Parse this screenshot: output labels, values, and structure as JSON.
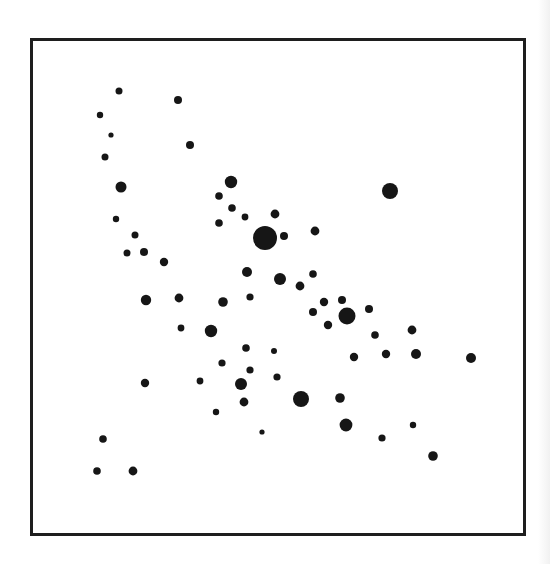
{
  "chart_data": {
    "type": "scatter",
    "title": "",
    "xlabel": "",
    "ylabel": "",
    "grid": false,
    "legend": null,
    "axis_ticks": false,
    "frame": {
      "x": 30,
      "y": 38,
      "width": 496,
      "height": 498,
      "stroke": "#1e1e1e",
      "stroke_width": 3
    },
    "marker_color": "#161616",
    "points": [
      {
        "x": 119,
        "y": 91,
        "r": 3.5
      },
      {
        "x": 178,
        "y": 100,
        "r": 4
      },
      {
        "x": 100,
        "y": 115,
        "r": 3.2
      },
      {
        "x": 111,
        "y": 135,
        "r": 2.6
      },
      {
        "x": 105,
        "y": 157,
        "r": 3.5
      },
      {
        "x": 190,
        "y": 145,
        "r": 4
      },
      {
        "x": 121,
        "y": 187,
        "r": 5.5
      },
      {
        "x": 116,
        "y": 219,
        "r": 3.2
      },
      {
        "x": 135,
        "y": 235,
        "r": 3.5
      },
      {
        "x": 127,
        "y": 253,
        "r": 3.5
      },
      {
        "x": 144,
        "y": 252,
        "r": 4
      },
      {
        "x": 164,
        "y": 262,
        "r": 4.2
      },
      {
        "x": 231,
        "y": 182,
        "r": 6.2
      },
      {
        "x": 219,
        "y": 196,
        "r": 3.8
      },
      {
        "x": 232,
        "y": 208,
        "r": 3.8
      },
      {
        "x": 245,
        "y": 217,
        "r": 3.4
      },
      {
        "x": 219,
        "y": 223,
        "r": 3.8
      },
      {
        "x": 275,
        "y": 214,
        "r": 4.4
      },
      {
        "x": 265,
        "y": 238,
        "r": 12
      },
      {
        "x": 284,
        "y": 236,
        "r": 4
      },
      {
        "x": 315,
        "y": 231,
        "r": 4.4
      },
      {
        "x": 390,
        "y": 191,
        "r": 8
      },
      {
        "x": 247,
        "y": 272,
        "r": 5
      },
      {
        "x": 280,
        "y": 279,
        "r": 6
      },
      {
        "x": 313,
        "y": 274,
        "r": 3.8
      },
      {
        "x": 300,
        "y": 286,
        "r": 4.4
      },
      {
        "x": 146,
        "y": 300,
        "r": 5.2
      },
      {
        "x": 179,
        "y": 298,
        "r": 4.4
      },
      {
        "x": 223,
        "y": 302,
        "r": 4.8
      },
      {
        "x": 250,
        "y": 297,
        "r": 3.6
      },
      {
        "x": 324,
        "y": 302,
        "r": 4.2
      },
      {
        "x": 342,
        "y": 300,
        "r": 4
      },
      {
        "x": 313,
        "y": 312,
        "r": 4
      },
      {
        "x": 347,
        "y": 316,
        "r": 8.5
      },
      {
        "x": 328,
        "y": 325,
        "r": 4.2
      },
      {
        "x": 369,
        "y": 309,
        "r": 4
      },
      {
        "x": 181,
        "y": 328,
        "r": 3.4
      },
      {
        "x": 211,
        "y": 331,
        "r": 6.2
      },
      {
        "x": 375,
        "y": 335,
        "r": 3.8
      },
      {
        "x": 412,
        "y": 330,
        "r": 4.4
      },
      {
        "x": 246,
        "y": 348,
        "r": 3.8
      },
      {
        "x": 274,
        "y": 351,
        "r": 3
      },
      {
        "x": 354,
        "y": 357,
        "r": 4.2
      },
      {
        "x": 386,
        "y": 354,
        "r": 4.2
      },
      {
        "x": 416,
        "y": 354,
        "r": 5
      },
      {
        "x": 471,
        "y": 358,
        "r": 5
      },
      {
        "x": 222,
        "y": 363,
        "r": 3.6
      },
      {
        "x": 250,
        "y": 370,
        "r": 3.6
      },
      {
        "x": 277,
        "y": 377,
        "r": 3.6
      },
      {
        "x": 145,
        "y": 383,
        "r": 4.2
      },
      {
        "x": 200,
        "y": 381,
        "r": 3.4
      },
      {
        "x": 241,
        "y": 384,
        "r": 6
      },
      {
        "x": 340,
        "y": 398,
        "r": 4.8
      },
      {
        "x": 244,
        "y": 402,
        "r": 4.4
      },
      {
        "x": 301,
        "y": 399,
        "r": 8
      },
      {
        "x": 216,
        "y": 412,
        "r": 3.2
      },
      {
        "x": 346,
        "y": 425,
        "r": 6.4
      },
      {
        "x": 413,
        "y": 425,
        "r": 3.2
      },
      {
        "x": 262,
        "y": 432,
        "r": 2.6
      },
      {
        "x": 382,
        "y": 438,
        "r": 3.6
      },
      {
        "x": 433,
        "y": 456,
        "r": 4.8
      },
      {
        "x": 103,
        "y": 439,
        "r": 3.8
      },
      {
        "x": 97,
        "y": 471,
        "r": 3.8
      },
      {
        "x": 133,
        "y": 471,
        "r": 4.4
      }
    ]
  }
}
